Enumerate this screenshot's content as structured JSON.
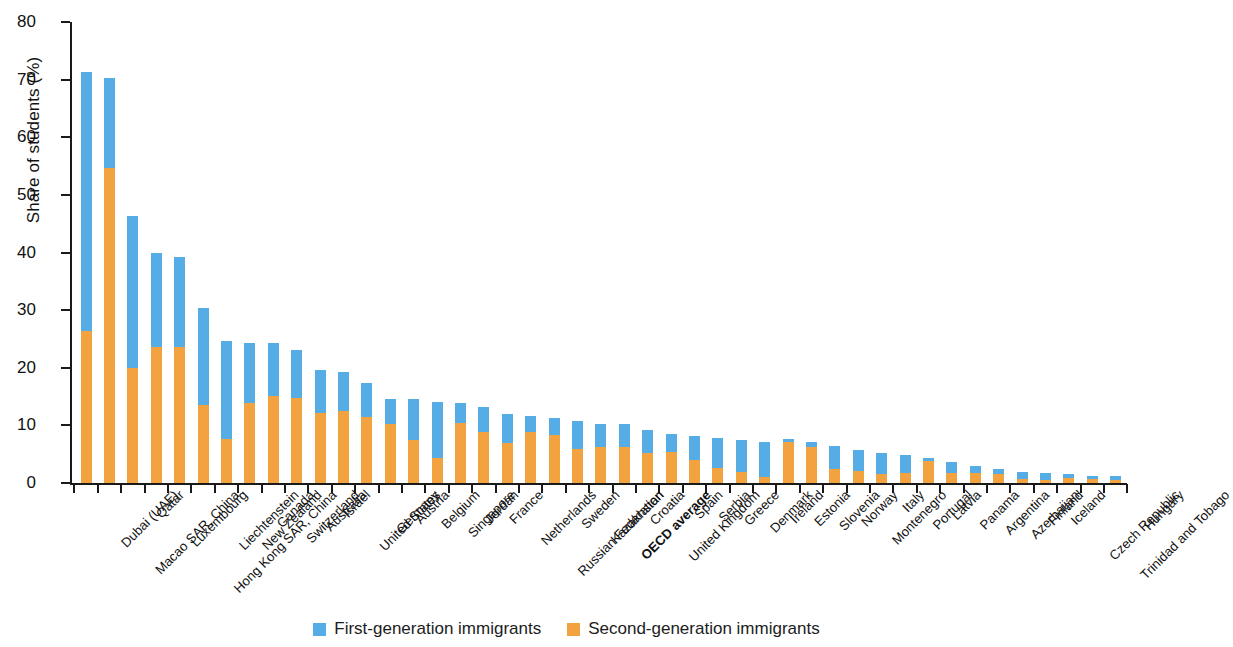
{
  "chart_data": {
    "type": "bar",
    "stacked": true,
    "title": "",
    "xlabel": "",
    "ylabel": "Share of students (%)",
    "ylim": [
      0,
      80
    ],
    "yticks": [
      0,
      10,
      20,
      30,
      40,
      50,
      60,
      70,
      80
    ],
    "grid": false,
    "legend_position": "bottom",
    "series": [
      {
        "name": "Second-generation immigrants",
        "color": "#f2a340",
        "values": [
          26.4,
          54.7,
          20.0,
          23.6,
          23.6,
          13.5,
          7.7,
          13.9,
          15.1,
          14.8,
          12.1,
          12.5,
          11.4,
          10.3,
          7.5,
          4.4,
          10.5,
          8.8,
          7.0,
          8.8,
          8.4,
          5.9,
          6.2,
          6.2,
          5.2,
          5.3,
          4.0,
          2.6,
          1.9,
          1.1,
          7.2,
          6.2,
          2.5,
          2.1,
          1.5,
          1.8,
          3.8,
          1.8,
          1.8,
          1.6,
          0.7,
          0.5,
          0.9,
          0.7,
          0.6
        ]
      },
      {
        "name": "First-generation immigrants",
        "color": "#56ace4",
        "values": [
          44.9,
          15.6,
          26.3,
          16.4,
          15.7,
          16.8,
          17.0,
          10.4,
          9.2,
          8.3,
          7.5,
          6.7,
          6.0,
          4.3,
          7.0,
          9.6,
          3.4,
          4.4,
          4.9,
          2.8,
          2.9,
          4.9,
          4.1,
          4.0,
          4.0,
          3.2,
          4.2,
          5.3,
          5.5,
          6.0,
          0.4,
          1.0,
          4.0,
          3.6,
          3.7,
          3.1,
          0.6,
          1.8,
          1.2,
          0.8,
          1.2,
          1.2,
          0.7,
          0.6,
          0.6
        ]
      }
    ],
    "categories": [
      "Dubai (UAE)",
      "Macao SAR, China",
      "Qatar",
      "Luxembourg",
      "Hong Kong SAR, China",
      "Liechtenstein",
      "New Zealand",
      "Canada",
      "Switzerland",
      "Australia",
      "Israel",
      "United States",
      "Germany",
      "Austria",
      "Belgium",
      "Singapore",
      "Jordan",
      "France",
      "Netherlands",
      "Russian Federation",
      "Sweden",
      "Kazakhstan",
      "OECD average",
      "Croatia",
      "United Kingdom",
      "Spain",
      "Serbia",
      "Greece",
      "Denmark",
      "Ireland",
      "Estonia",
      "Slovenia",
      "Norway",
      "Montenegro",
      "Italy",
      "Portugal",
      "Latvia",
      "Panama",
      "Argentina",
      "Azerbaijan",
      "Finland",
      "Iceland",
      "Czech Republic",
      "Trinidad and Tobago",
      "Hungary"
    ],
    "emphasized_category": "OECD average"
  },
  "legend": {
    "items": [
      {
        "label": "First-generation immigrants",
        "color": "#56ace4"
      },
      {
        "label": "Second-generation immigrants",
        "color": "#f2a340"
      }
    ]
  }
}
